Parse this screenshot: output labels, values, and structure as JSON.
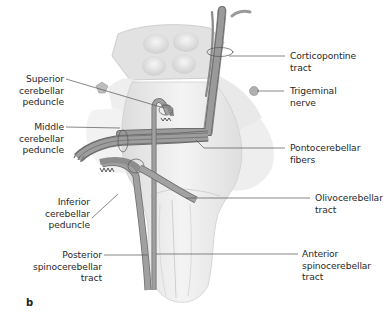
{
  "figure": {
    "panel_label": "b",
    "labels_left": [
      {
        "id": "superior",
        "text": "Superior\ncerebellar\npeduncle"
      },
      {
        "id": "middle",
        "text": "Middle\ncerebellar\npeduncle"
      },
      {
        "id": "inferior",
        "text": "Inferior\ncerebellar\npeduncle"
      },
      {
        "id": "posterior",
        "text": "Posterior\nspinocerebellar\ntract"
      }
    ],
    "labels_right": [
      {
        "id": "corticopontine",
        "text": "Corticopontine\ntract"
      },
      {
        "id": "trigeminal",
        "text": "Trigeminal\nnerve"
      },
      {
        "id": "pontocerebellar",
        "text": "Pontocerebellar\nfibers"
      },
      {
        "id": "olivocerebellar",
        "text": "Olivocerebellar\ntract"
      },
      {
        "id": "anterior",
        "text": "Anterior\nspinocerebellar\ntract"
      }
    ],
    "colors": {
      "tract_fill": "#8e8e8e",
      "tract_stroke": "#5a5a5a",
      "tissue_light": "#ececec",
      "tissue_mid": "#d8d8d8",
      "leader_line": "#555555",
      "text": "#2a2a2a"
    }
  }
}
